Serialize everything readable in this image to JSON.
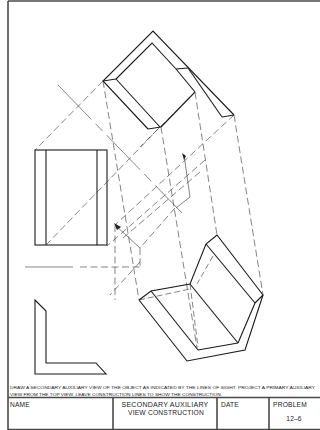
{
  "drawing": {
    "views": [
      "top-view",
      "front-view",
      "side-view",
      "primary-auxiliary-view"
    ],
    "colors": {
      "line": "#1a1a1a",
      "border": "#4a4a4a",
      "background": "#ffffff"
    }
  },
  "instructions": {
    "line1": "DRAW A SECONDARY AUXILIARY VIEW OF THE OBJECT AS INDICATED BY THE LINES OF SIGHT. PROJECT A PRIMARY AUXILIARY",
    "line2": "VIEW FROM THE TOP VIEW. LEAVE CONSTRUCTION LINES TO SHOW THE CONSTRUCTION."
  },
  "title_block": {
    "name_label": "NAME",
    "title_line1": "SECONDARY AUXILIARY",
    "title_line2": "VIEW CONSTRUCTION",
    "date_label": "DATE",
    "problem_label": "PROBLEM",
    "problem_number": "12–6"
  }
}
